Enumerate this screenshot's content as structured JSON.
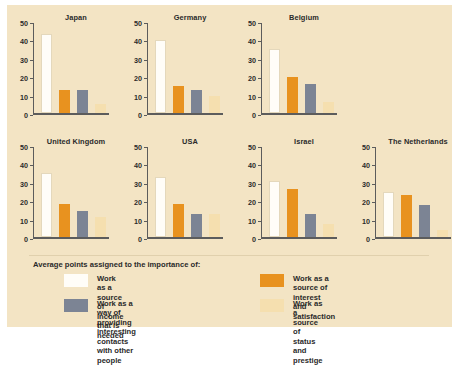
{
  "chart_data": {
    "type": "bar",
    "title": "",
    "subtitle": "",
    "xlabel": "",
    "ylabel": "",
    "ylim": [
      0,
      50
    ],
    "yticks": [
      0,
      10,
      20,
      30,
      40,
      50
    ],
    "grid": false,
    "legend_position": "bottom",
    "legend_title": "Average points assigned to the importance of:",
    "series": [
      {
        "name": "Work as a source of income that is needed",
        "color": "#fffdf8",
        "values": [
          43,
          40,
          35,
          35,
          33,
          30.5,
          24.5
        ]
      },
      {
        "name": "Work as a source of interest and satisfaction",
        "color": "#e8921f",
        "values": [
          13,
          15,
          20,
          18,
          18,
          26.5,
          23
        ]
      },
      {
        "name": "Work as a way of providing interesting contacts with other people",
        "color": "#7c8494",
        "values": [
          13,
          13,
          16,
          14.5,
          13,
          13,
          17.5
        ]
      },
      {
        "name": "Work as a source of status and prestige",
        "color": "#f5dfaf",
        "values": [
          5,
          9.5,
          6,
          11,
          13,
          7.5,
          4
        ]
      }
    ],
    "panels": [
      {
        "title": "Japan",
        "values": [
          43,
          13,
          13,
          5
        ]
      },
      {
        "title": "Germany",
        "values": [
          40,
          15,
          13,
          9.5
        ]
      },
      {
        "title": "Belgium",
        "values": [
          35,
          20,
          16,
          6
        ]
      },
      {
        "title": "United Kingdom",
        "values": [
          35,
          18,
          14.5,
          11
        ]
      },
      {
        "title": "USA",
        "values": [
          33,
          18,
          13,
          13
        ]
      },
      {
        "title": "Israel",
        "values": [
          30.5,
          26.5,
          13,
          7.5
        ]
      },
      {
        "title": "The Netherlands",
        "values": [
          24.5,
          23,
          17.5,
          4
        ]
      }
    ],
    "categories": [
      "Japan",
      "Germany",
      "Belgium",
      "United Kingdom",
      "USA",
      "Israel",
      "The Netherlands"
    ]
  },
  "legend": {
    "title": "Average points assigned to the importance of:",
    "items": [
      {
        "swatch": "white",
        "label": "Work as a source of income that is needed"
      },
      {
        "swatch": "orange",
        "label": "Work as a source of interest\nand satisfaction"
      },
      {
        "swatch": "gray",
        "label": "Work as a way of providing interesting\ncontacts with other people"
      },
      {
        "swatch": "pale",
        "label": "Work as a source of status\nand prestige"
      }
    ]
  },
  "colors": {
    "background": "#f3e4c4",
    "page": "#ffffff",
    "axis": "#5c5c5c",
    "text": "#2a2a2a",
    "bar_white": "#fffdf8",
    "bar_orange": "#e8921f",
    "bar_gray": "#7c8494",
    "bar_pale": "#f5dfaf"
  }
}
